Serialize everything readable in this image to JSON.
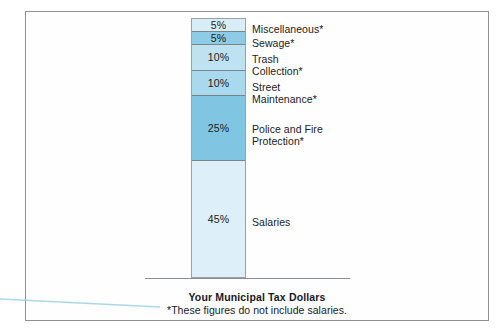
{
  "document": {
    "caption_title": "Your Municipal Tax Dollars",
    "caption_note": "*These figures do not include salaries."
  },
  "chart_data": {
    "type": "bar",
    "orientation": "vertical-stacked",
    "title": "Your Municipal Tax Dollars",
    "subtitle": "*These figures do not include salaries.",
    "xlabel": "",
    "ylabel": "",
    "grid": false,
    "legend": "right-callouts",
    "unit": "%",
    "total": 100,
    "categories": [
      "Miscellaneous*",
      "Sewage*",
      "Trash Collection*",
      "Street Maintenance*",
      "Police and Fire Protection*",
      "Salaries"
    ],
    "values": [
      5,
      5,
      10,
      10,
      25,
      45
    ],
    "segments": [
      {
        "label": "Miscellaneous*",
        "label_lines": "Miscellaneous*",
        "value": 5,
        "value_text": "5%",
        "color": "#d9edf6",
        "label_top": 24
      },
      {
        "label": "Sewage*",
        "label_lines": "Sewage*",
        "value": 5,
        "value_text": "5%",
        "color": "#8ecbe4",
        "label_top": 38
      },
      {
        "label": "Trash Collection*",
        "label_lines": "Trash\nCollection*",
        "value": 10,
        "value_text": "10%",
        "color": "#bfe2f1",
        "label_top": 54
      },
      {
        "label": "Street Maintenance*",
        "label_lines": "Street\nMaintenance*",
        "value": 10,
        "value_text": "10%",
        "color": "#a9d9ed",
        "label_top": 82
      },
      {
        "label": "Police and Fire Protection*",
        "label_lines": "Police and Fire\nProtection*",
        "value": 25,
        "value_text": "25%",
        "color": "#80c6e3",
        "label_top": 124
      },
      {
        "label": "Salaries",
        "label_lines": "Salaries",
        "value": 45,
        "value_text": "45%",
        "color": "#ddeff8",
        "label_top": 217
      }
    ]
  },
  "colors": {
    "frame": "#8e9194",
    "text": "#1d2022",
    "baseline": "#8a8f93",
    "scan_line": "#9fd0e2"
  }
}
